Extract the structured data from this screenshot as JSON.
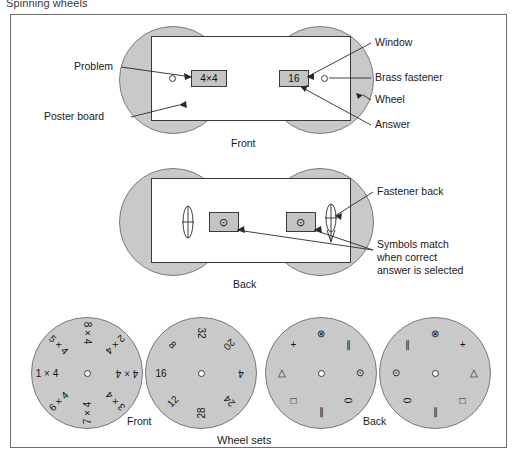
{
  "figure": {
    "title": "Spinning wheels",
    "caption_bottom": "Wheel sets"
  },
  "front_panel": {
    "caption": "Front",
    "window_problem": "4×4",
    "window_answer": "16",
    "labels": {
      "problem": "Problem",
      "poster_board": "Poster board",
      "window": "Window",
      "brass_fastener": "Brass fastener",
      "wheel": "Wheel",
      "answer": "Answer"
    }
  },
  "back_panel": {
    "caption": "Back",
    "window_symbol_left": "⊙",
    "window_symbol_right": "⊙",
    "labels": {
      "fastener_back": "Fastener back",
      "symbols_match_line1": "Symbols match",
      "symbols_match_line2": "when correct",
      "symbols_match_line3": "answer is selected"
    }
  },
  "wheel_sets": {
    "front_caption": "Front",
    "back_caption": "Back",
    "problem_wheel": {
      "name": "problem-wheel",
      "labels": [
        "8 × 4",
        "2 × 4",
        "4 × 4",
        "3 × 4",
        "7 × 4",
        "6 × 4",
        "1 × 4",
        "5 × 4"
      ],
      "angles": [
        0,
        45,
        90,
        135,
        180,
        225,
        270,
        315
      ]
    },
    "answer_wheel": {
      "name": "answer-wheel",
      "labels": [
        "32",
        "20",
        "4",
        "24",
        "28",
        "12",
        "16",
        "8"
      ],
      "angles": [
        0,
        45,
        90,
        135,
        180,
        225,
        270,
        315
      ]
    },
    "back_wheel_left": {
      "name": "back-symbol-wheel-left",
      "labels": [
        "⊗",
        "∥",
        "⊙",
        "⬭",
        "∥",
        "□",
        "△",
        "+"
      ],
      "angles": [
        0,
        45,
        90,
        135,
        180,
        225,
        270,
        315
      ]
    },
    "back_wheel_right": {
      "name": "back-symbol-wheel-right",
      "labels": [
        "⊗",
        "+",
        "△",
        "□",
        "∥",
        "⬭",
        "⊙",
        "∥"
      ],
      "angles": [
        0,
        45,
        90,
        135,
        180,
        225,
        270,
        315
      ]
    }
  },
  "colors": {
    "wheel_fill": "#c9c9c9",
    "window_fill": "#c4c4c4",
    "board_fill": "#ffffff",
    "outline": "#3a3a3a",
    "frame": "#6d6d6d"
  }
}
